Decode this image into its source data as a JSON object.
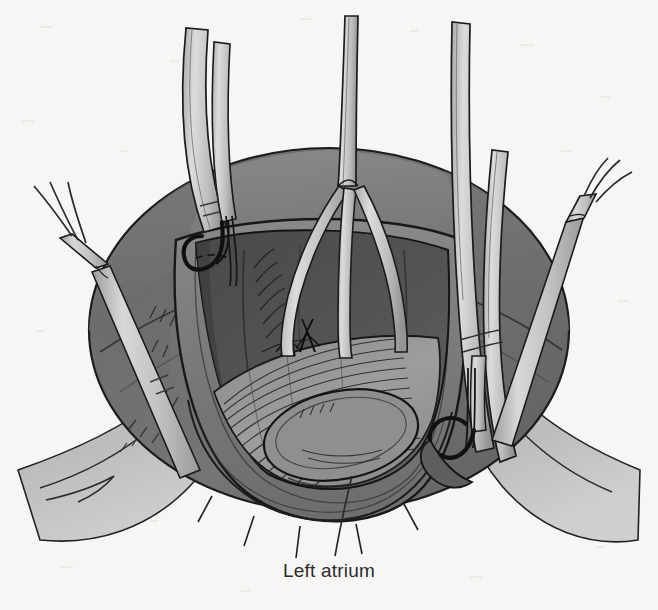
{
  "figure": {
    "caption": "Left atrium",
    "background_color": "#f7f6f4",
    "label_color": "#2b2b2b",
    "leader_line": {
      "name": "left-atrium-leader-line",
      "from": [
        335,
        555
      ],
      "to": [
        352,
        475
      ],
      "color": "#2b2b2b"
    }
  },
  "palette": {
    "paper": "#f7f6f4",
    "ink": "#1a1a1a",
    "atrium_outer_dark": "#6f6f6f",
    "atrium_outer_mid": "#7d7d7d",
    "atrium_cavity_dark": "#4c4c4c",
    "atrium_cavity_mid": "#5c5c5c",
    "endocardium_light": "#9a9a9a",
    "cut_rim": "#7a7a7a",
    "tissue_flap": "#b9b9b9",
    "instrument_light": "#cfcfcf",
    "instrument_mid": "#b0b0b0",
    "instrument_shadow": "#8f8f8f"
  },
  "anatomy": [
    {
      "name": "atrial-dome-outer-wall",
      "label": "Outer atrial wall",
      "tone": "#7d7d7d"
    },
    {
      "name": "atrial-cavity",
      "label": "Atrial cavity",
      "tone": "#545454"
    },
    {
      "name": "endocardial-surface",
      "label": "Endocardial surface",
      "tone": "#9a9a9a"
    },
    {
      "name": "trabeculated-wall",
      "label": "Trabeculated wall",
      "tone": "#8c8c8c"
    },
    {
      "name": "oval-orifice",
      "label": "Oval orifice",
      "tone": "#8e8e8e"
    },
    {
      "name": "cut-atrial-rim",
      "label": "Cut atrial rim",
      "tone": "#7a7a7a"
    },
    {
      "name": "pericardial-flap-left",
      "label": "Tissue flap (left)",
      "tone": "#bdbdbd"
    },
    {
      "name": "pericardial-flap-right",
      "label": "Tissue flap (right)",
      "tone": "#bdbdbd"
    }
  ],
  "sutures": [
    {
      "name": "suture-knot-left",
      "x": 288,
      "y": 345
    },
    {
      "name": "suture-knot-right",
      "x": 307,
      "y": 340
    }
  ],
  "instruments": [
    {
      "name": "rake-retractor-far-left",
      "label": "Three-prong rake retractor",
      "prongs": 3,
      "position": "far-left"
    },
    {
      "name": "ribbon-retractor-upper-left",
      "label": "Ribbon retractor",
      "prongs": 0,
      "position": "upper-left"
    },
    {
      "name": "hook-retractor-upper-left",
      "label": "Hook retractor",
      "prongs": 0,
      "position": "upper-left-rim"
    },
    {
      "name": "rake-retractor-center",
      "label": "Three-prong rake retractor",
      "prongs": 3,
      "position": "center"
    },
    {
      "name": "ribbon-retractor-right-a",
      "label": "Ribbon retractor",
      "prongs": 0,
      "position": "right"
    },
    {
      "name": "ribbon-retractor-right-b",
      "label": "Ribbon retractor",
      "prongs": 0,
      "position": "right"
    },
    {
      "name": "hook-retractor-right",
      "label": "Hook retractor",
      "prongs": 0,
      "position": "right-rim"
    },
    {
      "name": "rake-retractor-far-right",
      "label": "Three-prong rake retractor",
      "prongs": 3,
      "position": "far-right"
    }
  ]
}
